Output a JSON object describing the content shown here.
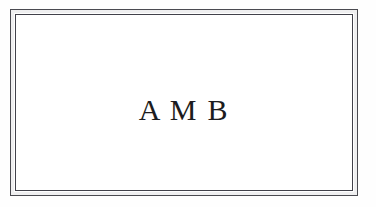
{
  "document": {
    "type": "bookplate",
    "background_color": "#ffffff"
  },
  "frame": {
    "style": "double-rule rectangle",
    "outer_line_color": "#4a4a50",
    "inner_line_color": "#41414a"
  },
  "plate": {
    "monogram": "A M B",
    "text_color": "#1c1c20"
  }
}
